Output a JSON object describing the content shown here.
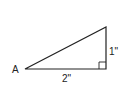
{
  "diagram": {
    "type": "right-triangle",
    "stroke_color": "#222222",
    "background": "#ffffff",
    "vertices": {
      "A": {
        "x": 25,
        "y": 69
      },
      "right_angle": {
        "x": 106,
        "y": 69
      },
      "top": {
        "x": 106,
        "y": 27
      }
    },
    "labels": {
      "vertex_a": "A",
      "base_length": "2\"",
      "height_length": "1\""
    },
    "right_angle_marker": true
  }
}
